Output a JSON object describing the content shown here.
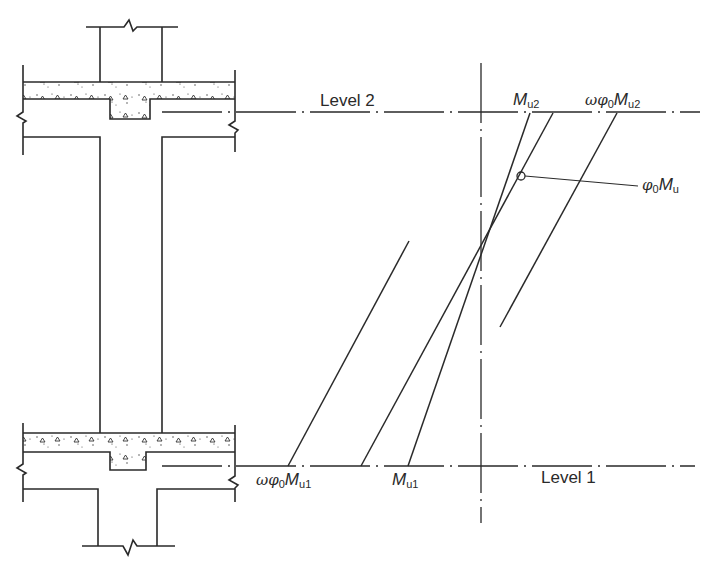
{
  "diagram": {
    "type": "structural-moment-diagram",
    "levels": [
      {
        "id": "level-2",
        "label": "Level 2"
      },
      {
        "id": "level-1",
        "label": "Level 1"
      }
    ],
    "labels": {
      "mu2": {
        "symbol": "M",
        "subscript": "u2"
      },
      "omega_phi0_mu2": {
        "prefix": "ωφ",
        "prefix_sub": "0",
        "symbol": "M",
        "subscript": "u2"
      },
      "phi0_mu": {
        "prefix": "φ",
        "prefix_sub": "0",
        "symbol": "M",
        "subscript": "u"
      },
      "omega_phi0_mu1": {
        "prefix": "ωφ",
        "prefix_sub": "0",
        "symbol": "M",
        "subscript": "u1"
      },
      "mu1": {
        "symbol": "M",
        "subscript": "u1"
      }
    },
    "colors": {
      "line": "#2a2a2a",
      "background": "#ffffff"
    }
  }
}
